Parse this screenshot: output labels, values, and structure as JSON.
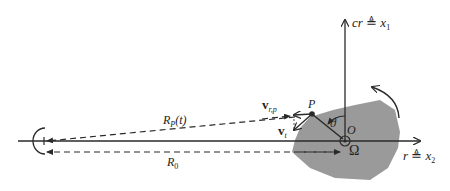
{
  "diagram": {
    "type": "geometry",
    "colors": {
      "line": "#2a2a2a",
      "target_fill": "#9a9a9a",
      "background": "#ffffff"
    },
    "labels": {
      "vertical_axis": {
        "main": "cr",
        "def": "≜",
        "var": "x",
        "sub": "1"
      },
      "horizontal_axis": {
        "main": "r",
        "def": "≜",
        "var": "x",
        "sub": "2"
      },
      "point_p": "P",
      "origin": "O",
      "rotation_rate": "Ω",
      "angle": "ϑ",
      "range_p": {
        "main": "R",
        "sub": "P",
        "arg": "(t)"
      },
      "range_0": {
        "main": "R",
        "sub": "0"
      },
      "velocity_radial": {
        "main": "v",
        "sub": "r,p"
      },
      "velocity_tangential": {
        "main": "v",
        "sub": "t"
      }
    }
  }
}
